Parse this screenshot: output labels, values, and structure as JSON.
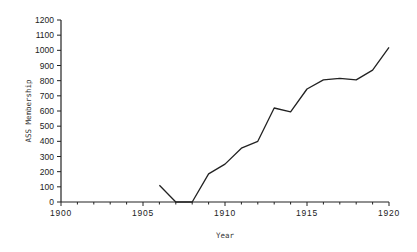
{
  "chart_data": {
    "type": "line",
    "title": "",
    "xlabel": "Year",
    "ylabel": "ASS Membership",
    "xlim": [
      1900,
      1920
    ],
    "ylim": [
      0,
      1200
    ],
    "x_ticks": [
      1900,
      1905,
      1910,
      1915,
      1920
    ],
    "y_ticks": [
      0,
      100,
      200,
      300,
      400,
      500,
      600,
      700,
      800,
      900,
      1000,
      1100,
      1200
    ],
    "grid": false,
    "legend": null,
    "series": [
      {
        "name": "ASS Membership",
        "color": "#222222",
        "x": [
          1906,
          1907,
          1908,
          1909,
          1910,
          1911,
          1912,
          1913,
          1914,
          1915,
          1916,
          1917,
          1918,
          1919,
          1920
        ],
        "values": [
          110,
          0,
          0,
          185,
          250,
          355,
          400,
          620,
          595,
          745,
          805,
          815,
          805,
          870,
          1020
        ]
      }
    ]
  }
}
